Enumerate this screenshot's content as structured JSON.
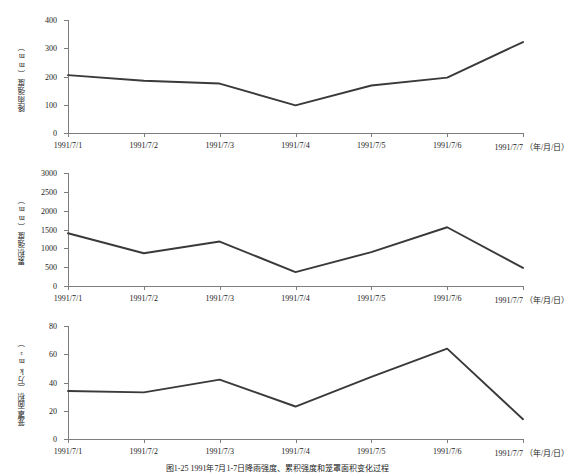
{
  "caption": "图1-25  1991年7月1-7日降雨强度、累积强度和笼罩面积变化过程",
  "x_axis_unit": "（年/月/日）",
  "categories": [
    "1991/7/1",
    "1991/7/2",
    "1991/7/3",
    "1991/7/4",
    "1991/7/5",
    "1991/7/6",
    "1991/7/7"
  ],
  "line_color": "#3a3a3a",
  "axis_color": "#7d7d7d",
  "chart_data": [
    {
      "type": "line",
      "title": "",
      "ylabel": "降雨强度（mm）",
      "xlabel": "（年/月/日）",
      "categories": [
        "1991/7/1",
        "1991/7/2",
        "1991/7/3",
        "1991/7/4",
        "1991/7/5",
        "1991/7/6",
        "1991/7/7"
      ],
      "values": [
        205,
        185,
        175,
        98,
        168,
        196,
        322
      ],
      "ylim": [
        0,
        400
      ],
      "yticks": [
        0,
        100,
        200,
        300,
        400
      ],
      "grid": false,
      "legend": "none"
    },
    {
      "type": "line",
      "title": "",
      "ylabel": "累积强度（mm）",
      "xlabel": "（年/月/日）",
      "categories": [
        "1991/7/1",
        "1991/7/2",
        "1991/7/3",
        "1991/7/4",
        "1991/7/5",
        "1991/7/6",
        "1991/7/7"
      ],
      "values": [
        1400,
        870,
        1180,
        370,
        900,
        1560,
        480
      ],
      "ylim": [
        0,
        3000
      ],
      "yticks": [
        0,
        500,
        1000,
        1500,
        2000,
        2500,
        3000
      ],
      "grid": false,
      "legend": "none"
    },
    {
      "type": "line",
      "title": "",
      "ylabel": "笼罩面积（万km²）",
      "xlabel": "（年/月/日）",
      "categories": [
        "1991/7/1",
        "1991/7/2",
        "1991/7/3",
        "1991/7/4",
        "1991/7/5",
        "1991/7/6",
        "1991/7/7"
      ],
      "values": [
        34,
        33,
        42,
        23,
        44,
        64,
        14
      ],
      "ylim": [
        0,
        80
      ],
      "yticks": [
        0,
        20,
        40,
        60,
        80
      ],
      "grid": false,
      "legend": "none"
    }
  ]
}
